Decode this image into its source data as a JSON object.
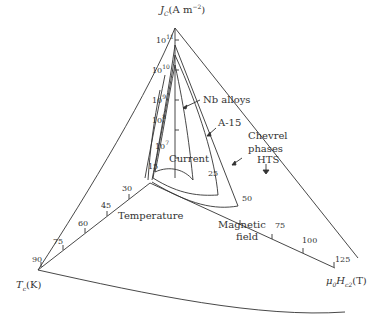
{
  "diagram": {
    "type": "3d-critical-surface",
    "axes": {
      "current": {
        "title": "J_C (A m^-2)",
        "title_main": "J",
        "title_sub": "C",
        "title_unit": "(A m",
        "title_exp": "−2",
        "title_close": ")",
        "ticks": [
          {
            "base": "10",
            "exp": "11"
          },
          {
            "base": "10",
            "exp": "10"
          },
          {
            "base": "10",
            "exp": "9"
          },
          {
            "base": "10",
            "exp": "8"
          },
          {
            "base": "10",
            "exp": "7"
          }
        ]
      },
      "temperature": {
        "title_main": "T",
        "title_sub": "c",
        "title_unit": "(K)",
        "ticks": [
          "15",
          "30",
          "45",
          "60",
          "75",
          "90"
        ]
      },
      "field": {
        "title_main": "μ",
        "title_sub0": "0",
        "title_h": "H",
        "title_sub": "c2",
        "title_unit": "(T)",
        "ticks": [
          "25",
          "50",
          "75",
          "100",
          "125"
        ]
      }
    },
    "labels": {
      "nb_alloys": "Nb alloys",
      "a15": "A-15",
      "chevrel": "Chevrel",
      "chevrel2": "phases",
      "hts": "HTS",
      "current": "Current",
      "temperature": "Temperature",
      "magnetic": "Magnetic",
      "field": "field"
    },
    "colors": {
      "line": "#333333",
      "background": "#ffffff"
    }
  }
}
